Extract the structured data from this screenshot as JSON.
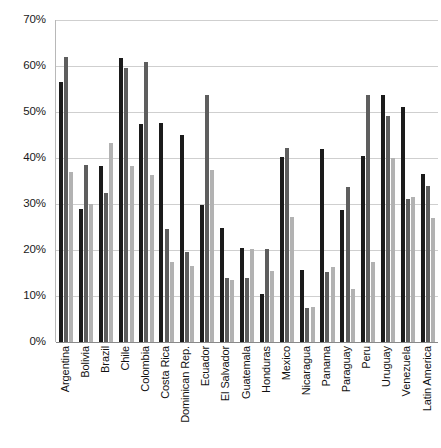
{
  "chart_data": {
    "type": "bar",
    "title": "",
    "subtitle": "",
    "xlabel": "",
    "ylabel": "",
    "ylim": [
      0,
      70
    ],
    "ytick_labels": [
      "70%",
      "60%",
      "50%",
      "40%",
      "30%",
      "20%",
      "10%",
      "0%"
    ],
    "ytick_values": [
      70,
      60,
      50,
      40,
      30,
      20,
      10,
      0
    ],
    "grid": true,
    "legend": "none",
    "orientation": "vertical",
    "categories": [
      "Argentina",
      "Bolivia",
      "Brazil",
      "Chile",
      "Colombia",
      "Costa Rica",
      "Dominican Rep.",
      "Ecuador",
      "El Salvador",
      "Guatemala",
      "Honduras",
      "Mexico",
      "Nicaragua",
      "Panama",
      "Paraguay",
      "Peru",
      "Uruguay",
      "Venezuela",
      "Latin America"
    ],
    "series": [
      {
        "name": "series-1",
        "color": "#1b1b1b",
        "values": [
          56.5,
          29.0,
          38.3,
          61.8,
          47.5,
          47.7,
          45.1,
          29.8,
          24.8,
          20.5,
          10.5,
          40.2,
          15.6,
          42.0,
          28.7,
          40.4,
          53.8,
          51.0,
          36.5
        ]
      },
      {
        "name": "series-2",
        "color": "#5e5e5e",
        "values": [
          62.0,
          38.5,
          32.4,
          59.5,
          60.8,
          24.5,
          19.6,
          53.6,
          14.0,
          14.0,
          20.3,
          42.2,
          7.4,
          15.3,
          33.6,
          53.8,
          49.2,
          31.0,
          34.0
        ]
      },
      {
        "name": "series-3",
        "color": "#b2b2b2",
        "values": [
          37.0,
          30.0,
          43.3,
          38.2,
          36.3,
          17.4,
          16.6,
          37.5,
          13.5,
          20.3,
          15.5,
          27.2,
          7.7,
          16.2,
          11.5,
          17.3,
          40.0,
          31.5,
          27.0
        ]
      }
    ]
  }
}
